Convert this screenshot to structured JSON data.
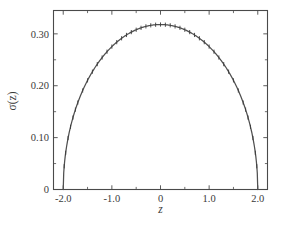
{
  "chart_data": {
    "type": "line",
    "title": "",
    "subtitle": "",
    "xlabel": "z",
    "ylabel": "σ(z)",
    "xlim": [
      -2.2,
      2.2
    ],
    "ylim": [
      0,
      0.345
    ],
    "grid": false,
    "legend": null,
    "x_ticks": [
      -2.0,
      -1.0,
      0,
      1.0,
      2.0
    ],
    "x_tick_labels": [
      "-2.0",
      "-1.0",
      "0",
      "1.0",
      "2.0"
    ],
    "x_minor_ticks": [
      -1.5,
      -0.5,
      0.5,
      1.5
    ],
    "y_ticks": [
      0,
      0.1,
      0.2,
      0.3
    ],
    "y_tick_labels": [
      "0",
      "0.10",
      "0.20",
      "0.30"
    ],
    "y_minor_ticks": [
      0.05,
      0.15,
      0.25
    ],
    "series": [
      {
        "name": "σ(z)",
        "marker": "vertical-dash",
        "line_color": "#4f4f4f",
        "x": [
          -1.98,
          -1.95,
          -1.9,
          -1.85,
          -1.8,
          -1.75,
          -1.7,
          -1.6,
          -1.5,
          -1.4,
          -1.3,
          -1.2,
          -1.1,
          -1.0,
          -0.9,
          -0.8,
          -0.7,
          -0.6,
          -0.5,
          -0.4,
          -0.3,
          -0.2,
          -0.1,
          0.0,
          0.1,
          0.2,
          0.3,
          0.4,
          0.5,
          0.6,
          0.7,
          0.8,
          0.9,
          1.0,
          1.1,
          1.2,
          1.3,
          1.4,
          1.5,
          1.6,
          1.7,
          1.75,
          1.8,
          1.85,
          1.9,
          1.95,
          1.98
        ],
        "y": [
          0.0225,
          0.0352,
          0.0492,
          0.0597,
          0.0684,
          0.076,
          0.0827,
          0.0947,
          0.1053,
          0.1149,
          0.1236,
          0.1316,
          0.139,
          0.1459,
          0.1523,
          0.1582,
          0.1637,
          0.1688,
          0.1734,
          0.1776,
          0.1813,
          0.1845,
          0.1866,
          0.1873,
          0.1866,
          0.1845,
          0.1813,
          0.1776,
          0.1734,
          0.1688,
          0.1637,
          0.1582,
          0.1523,
          0.1459,
          0.139,
          0.1316,
          0.1236,
          0.1149,
          0.1053,
          0.0947,
          0.0827,
          0.076,
          0.0684,
          0.0597,
          0.0492,
          0.0352,
          0.0225
        ]
      }
    ],
    "peak": {
      "x": 0.0,
      "y": 0.318
    },
    "support": [
      -2.0,
      2.0
    ]
  }
}
